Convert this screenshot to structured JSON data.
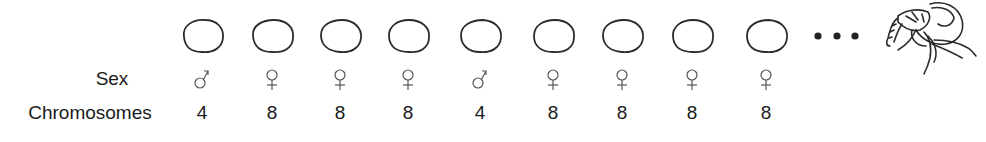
{
  "labels": {
    "sex": "Sex",
    "chromosomes": "Chromosomes"
  },
  "eggs": [
    {
      "sex": "male",
      "sex_symbol": "♂",
      "chromosomes": "4"
    },
    {
      "sex": "female",
      "sex_symbol": "♀",
      "chromosomes": "8"
    },
    {
      "sex": "female",
      "sex_symbol": "♀",
      "chromosomes": "8"
    },
    {
      "sex": "female",
      "sex_symbol": "♀",
      "chromosomes": "8"
    },
    {
      "sex": "male",
      "sex_symbol": "♂",
      "chromosomes": "4"
    },
    {
      "sex": "female",
      "sex_symbol": "♀",
      "chromosomes": "8"
    },
    {
      "sex": "female",
      "sex_symbol": "♀",
      "chromosomes": "8"
    },
    {
      "sex": "female",
      "sex_symbol": "♀",
      "chromosomes": "8"
    },
    {
      "sex": "female",
      "sex_symbol": "♀",
      "chromosomes": "8"
    }
  ],
  "continuation": "...",
  "icons": {
    "egg": "egg-outline-icon",
    "male": "male-symbol-icon",
    "female": "female-symbol-icon",
    "mite": "mite-drawing-icon"
  },
  "colors": {
    "stroke": "#2b2b2b",
    "symbol": "#555555",
    "text": "#1a1a1a"
  }
}
